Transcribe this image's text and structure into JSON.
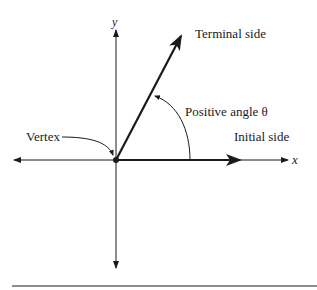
{
  "diagram": {
    "labels": {
      "terminal_side": "Terminal side",
      "positive_angle": "Positive angle θ",
      "initial_side": "Initial side",
      "vertex": "Vertex",
      "x_axis": "x",
      "y_axis": "y"
    },
    "colors": {
      "ink": "#1a1a1a",
      "background": "#ffffff"
    }
  }
}
